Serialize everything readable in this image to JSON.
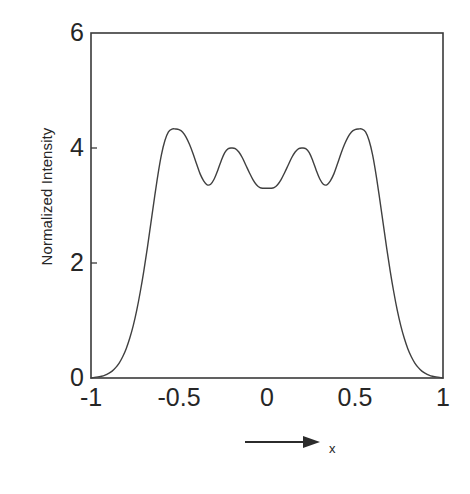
{
  "figure": {
    "background_color": "#ffffff",
    "line_color": "#404040",
    "axis_color": "#3a3a3a",
    "text_color": "#262626"
  },
  "axis_arrow": {
    "name": "x-direction-arrow",
    "label": "x"
  },
  "chart_data": {
    "type": "line",
    "title": "",
    "subtitle": "",
    "xlabel": "x",
    "ylabel": "Normalized Intensity",
    "xlim": [
      -1,
      1
    ],
    "ylim": [
      0,
      6
    ],
    "xticks": [
      -1,
      -0.5,
      0,
      0.5,
      1
    ],
    "xticklabels": [
      "-1",
      "-0.5",
      "0",
      "0.5",
      "1"
    ],
    "yticks": [
      0,
      2,
      4,
      6
    ],
    "yticklabels": [
      "0",
      "2",
      "4",
      "6"
    ],
    "grid": false,
    "legend": null,
    "legend_position": "none",
    "annotations": [
      {
        "text": "x",
        "role": "x-axis-arrow-label"
      }
    ],
    "series": [
      {
        "name": "Normalized Intensity",
        "color": "#404040",
        "linewidth": 1.4,
        "features": {
          "peaks": [
            {
              "x": -0.5,
              "y": 4.32
            },
            {
              "x": -0.17,
              "y": 4.0
            },
            {
              "x": 0.17,
              "y": 4.0
            },
            {
              "x": 0.5,
              "y": 4.32
            }
          ],
          "valleys": [
            {
              "x": -0.33,
              "y": 3.36
            },
            {
              "x": 0.0,
              "y": 3.3
            },
            {
              "x": 0.33,
              "y": 3.36
            }
          ],
          "endpoints": [
            {
              "x": -1.0,
              "y": 0.0
            },
            {
              "x": 1.0,
              "y": 0.0
            }
          ]
        },
        "x": [
          -1.0,
          -0.98,
          -0.96,
          -0.94,
          -0.92,
          -0.9,
          -0.88,
          -0.86,
          -0.84,
          -0.82,
          -0.8,
          -0.78,
          -0.76,
          -0.74,
          -0.72,
          -0.7,
          -0.68,
          -0.66,
          -0.64,
          -0.62,
          -0.6,
          -0.58,
          -0.56,
          -0.54,
          -0.52,
          -0.5,
          -0.48,
          -0.46,
          -0.44,
          -0.42,
          -0.4,
          -0.38,
          -0.36,
          -0.34,
          -0.32,
          -0.3,
          -0.28,
          -0.26,
          -0.24,
          -0.22,
          -0.2,
          -0.18,
          -0.16,
          -0.14,
          -0.12,
          -0.1,
          -0.08,
          -0.06,
          -0.04,
          -0.02,
          0.0,
          0.02,
          0.04,
          0.06,
          0.08,
          0.1,
          0.12,
          0.14,
          0.16,
          0.18,
          0.2,
          0.22,
          0.24,
          0.26,
          0.28,
          0.3,
          0.32,
          0.34,
          0.36,
          0.38,
          0.4,
          0.42,
          0.44,
          0.46,
          0.48,
          0.5,
          0.52,
          0.54,
          0.56,
          0.58,
          0.6,
          0.62,
          0.64,
          0.66,
          0.68,
          0.7,
          0.72,
          0.74,
          0.76,
          0.78,
          0.8,
          0.82,
          0.84,
          0.86,
          0.88,
          0.9,
          0.92,
          0.94,
          0.96,
          0.98,
          1.0
        ],
        "y": [
          0.0,
          0.01,
          0.02,
          0.03,
          0.05,
          0.08,
          0.12,
          0.18,
          0.26,
          0.37,
          0.51,
          0.69,
          0.91,
          1.18,
          1.5,
          1.86,
          2.26,
          2.69,
          3.12,
          3.53,
          3.88,
          4.13,
          4.28,
          4.33,
          4.33,
          4.32,
          4.28,
          4.19,
          4.06,
          3.9,
          3.72,
          3.55,
          3.43,
          3.36,
          3.37,
          3.46,
          3.61,
          3.78,
          3.92,
          3.99,
          4.0,
          3.99,
          3.93,
          3.83,
          3.7,
          3.57,
          3.45,
          3.36,
          3.31,
          3.3,
          3.3,
          3.3,
          3.31,
          3.36,
          3.45,
          3.57,
          3.7,
          3.83,
          3.93,
          3.99,
          4.0,
          3.99,
          3.92,
          3.78,
          3.61,
          3.46,
          3.37,
          3.36,
          3.43,
          3.55,
          3.72,
          3.9,
          4.06,
          4.19,
          4.28,
          4.32,
          4.33,
          4.33,
          4.28,
          4.13,
          3.88,
          3.53,
          3.12,
          2.69,
          2.26,
          1.86,
          1.5,
          1.18,
          0.91,
          0.69,
          0.51,
          0.37,
          0.26,
          0.18,
          0.12,
          0.08,
          0.05,
          0.03,
          0.02,
          0.01,
          0.0
        ]
      }
    ]
  }
}
